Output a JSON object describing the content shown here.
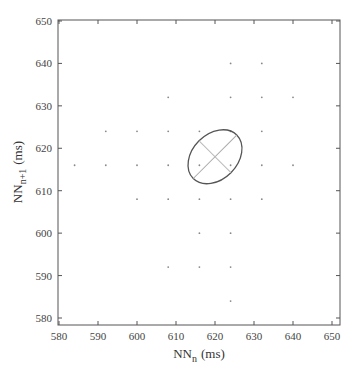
{
  "chart_data": {
    "type": "scatter",
    "title": "",
    "xlabel": "NN_n (ms)",
    "ylabel": "NN_n+1 (ms)",
    "xlabel_main": "NN",
    "xlabel_sub": "n",
    "xlabel_unit": "(ms)",
    "ylabel_main": "NN",
    "ylabel_sub": "n+1",
    "ylabel_unit": "(ms)",
    "xlim": [
      580,
      652
    ],
    "ylim": [
      578,
      651
    ],
    "xticks": [
      580,
      590,
      600,
      610,
      620,
      630,
      640,
      650
    ],
    "yticks": [
      580,
      590,
      600,
      610,
      620,
      630,
      640,
      650
    ],
    "grid": false,
    "points": [
      [
        624,
        640
      ],
      [
        632,
        640
      ],
      [
        608,
        632
      ],
      [
        624,
        632
      ],
      [
        632,
        632
      ],
      [
        640,
        632
      ],
      [
        592,
        624
      ],
      [
        600,
        624
      ],
      [
        608,
        624
      ],
      [
        616,
        624
      ],
      [
        624,
        624
      ],
      [
        632,
        624
      ],
      [
        584,
        616
      ],
      [
        592,
        616
      ],
      [
        600,
        616
      ],
      [
        608,
        616
      ],
      [
        616,
        616
      ],
      [
        624,
        616
      ],
      [
        632,
        616
      ],
      [
        640,
        616
      ],
      [
        600,
        608
      ],
      [
        608,
        608
      ],
      [
        616,
        608
      ],
      [
        624,
        608
      ],
      [
        632,
        608
      ],
      [
        616,
        600
      ],
      [
        624,
        600
      ],
      [
        608,
        592
      ],
      [
        616,
        592
      ],
      [
        624,
        592
      ],
      [
        624,
        584
      ]
    ],
    "ellipse": {
      "cx": 620,
      "cy": 618,
      "sd1": 5.5,
      "sd2": 7.5,
      "angle_deg": 45
    }
  }
}
